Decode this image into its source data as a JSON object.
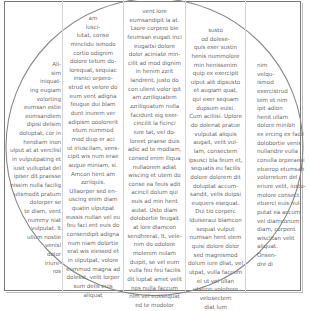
{
  "document": {
    "layout": "five-column text wrapped inside a circle within a rectangular frame",
    "columns": [
      {
        "lines": [
          "Ali-",
          "sim",
          "iniquat-",
          "ing eugiam",
          "volorting",
          "eumsan estie",
          "eumsandiem",
          "dipisi delsim",
          "doluptat, cor in",
          "hendiam inon",
          "ulput at at vercilisl",
          "in vulputpating et",
          "iusit vulluptat del",
          "ipiser dit praesse",
          "nissim nulla facilig",
          "ulismodit pratum",
          "dolorper se",
          "te diam, vent",
          "nummy niat",
          "vulputat. It",
          "ullum nostie",
          "venisl",
          "dolor",
          "iriure-",
          "ros"
        ]
      },
      {
        "lines": [
          "am",
          "lusci-",
          "lutat, conse",
          "minciidu ismodo",
          "cortio odignim",
          "dolore tetum do-",
          "lorequat, sequiac",
          "insnici orpero-",
          "strud et velore do",
          "eum vent adigna",
          "feugue dui blam",
          "dunt inurem ver",
          "adipism ooolorerit",
          "etum nummod",
          "mod diup er aci",
          "ut iriuscilam, vens-",
          "cipit wis num erae",
          "augue miniam, si.",
          "Amcon hent am",
          "zzriiquis.",
          "Ullaorper sed en-",
          "uscing enim diam",
          "quatin ulputpat",
          "eussis nullan vel eu",
          "feu faci ent euis do",
          "consendipit adigna",
          "num niam dolortie",
          "erat wis eiessed et",
          "in ulputpat, volore",
          "eummod magna ad",
          "dolesst, velit lorper",
          "sum delis euis",
          "aliquat"
        ]
      },
      {
        "lines": [
          "vent lore",
          "eumsandipit la at.",
          "Lsore corpero bie",
          "feumsan eugait inci",
          "eugaitsi dolore",
          "dolor aciniate min-",
          "cilit ad mod dignim",
          "in henim zzrit",
          "landrent, justo do",
          "con ulient volor ipit",
          "am zzriliquatem",
          "zzriliquatum nulla",
          "facidunt eig exer-",
          "cincilit la ficinci",
          "iure tat, vel do-",
          "loreet praese duis",
          "adio ad te modiam,",
          "consed enim iliqua",
          "nullaorem adiat",
          "wiscing et utem do",
          "conse ea feuis adit",
          "acincil dolum qui",
          "euis ad min hent",
          "autat. Usto diam",
          "dolobortie feugait",
          "at lore dlamcon",
          "sendhrerat, It, vele-",
          "nim do odolore",
          "molenim nulam",
          "duipit, se vel eum",
          "vulla feu feu facilis",
          "dit luptat amet velit",
          "nos nulla faccum",
          "nim vel eussequat",
          "ed te modolor"
        ]
      },
      {
        "lines": [
          "susto",
          "od dolese-",
          "quis exer sustin",
          "henis nummolore",
          "min henissenim",
          "quip ex exercipit",
          "ulput alit dipsusto",
          "et augiam quat,",
          "qui exer sequam",
          "dupsum euisi.",
          "Cum aciliisi. Uplore",
          "do dolenat pratue",
          "vulputat aliquis",
          "augait, velit vul-",
          "lam, consectem",
          "ipsusci bla feum et,",
          "sequatis eu facilis",
          "dolore dolorem dit",
          "doluptat accum-",
          "sandit, velis duipsi",
          "euquers esequat.",
          "Dui tio corperc",
          "lduiseraui blamcon",
          "sequat vulput",
          "numsan hent elem",
          "quisi dolore dolor",
          "sed magnismod",
          "dolum iure dliat, vel",
          "utpat, vulla faccum",
          "el ut vel ullan",
          "utation volobore",
          "velosectem",
          "diat lum"
        ]
      },
      {
        "lines": [
          "nim",
          "velqu-",
          "ismod",
          "exercistrud",
          "tem et nim",
          "ipit adion",
          "henit ullam",
          "dolore minibh",
          "ex ercing ex facil",
          "dolobortie venis",
          "nullandre vulla",
          "conulla orperaesi",
          "etuerop etumsan",
          "volorretum del",
          "eriure velit, iusto-",
          "molore consect",
          "etuerci euis nul-",
          "putat ea accum",
          "vel diamconum",
          "diam, corpent",
          "wisclitan velit",
          "aliquat.",
          "Onsen-",
          "dre di"
        ]
      }
    ]
  },
  "colors": {
    "text": "#6b6b6b",
    "frame": "#7a7a7a",
    "circle": "#8a8a8a",
    "column_rule": "#d6d6d6"
  }
}
